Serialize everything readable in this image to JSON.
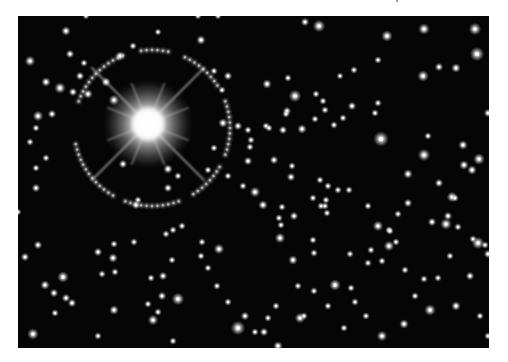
{
  "image": {
    "description": "Grayscale astronomical photograph of a dense starfield with a very bright diffraction-spiked star surrounded by a ring of lensed arcs",
    "background_color": "#050505",
    "page_color": "#ffffff",
    "bright_star": {
      "x": 130,
      "y": 108,
      "core_radius": 16,
      "glow_radius": 44,
      "spike_length": 80
    },
    "ring": {
      "cx": 134,
      "cy": 112,
      "r": 78
    },
    "ring_arcs": [
      {
        "start": 200,
        "end": 250
      },
      {
        "start": 262,
        "end": 282
      },
      {
        "start": 295,
        "end": 330
      },
      {
        "start": 340,
        "end": 380
      },
      {
        "start": 30,
        "end": 60
      },
      {
        "start": 70,
        "end": 110
      },
      {
        "start": 120,
        "end": 170
      }
    ],
    "stars": [
      [
        12,
        45,
        2.2
      ],
      [
        52,
        38,
        1.8
      ],
      [
        66,
        47,
        1.6
      ],
      [
        28,
        66,
        2
      ],
      [
        42,
        72,
        2.4
      ],
      [
        55,
        76,
        1.8
      ],
      [
        70,
        78,
        2
      ],
      [
        88,
        66,
        2
      ],
      [
        96,
        84,
        2.2
      ],
      [
        102,
        40,
        2
      ],
      [
        115,
        30,
        1.6
      ],
      [
        140,
        16,
        1.5
      ],
      [
        183,
        24,
        2
      ],
      [
        196,
        55,
        1.6
      ],
      [
        210,
        60,
        1.8
      ],
      [
        204,
        74,
        1.6
      ],
      [
        20,
        100,
        2.2
      ],
      [
        34,
        98,
        1.8
      ],
      [
        18,
        112,
        1.6
      ],
      [
        12,
        126,
        1.6
      ],
      [
        28,
        142,
        1.6
      ],
      [
        18,
        152,
        1.6
      ],
      [
        62,
        60,
        1.8
      ],
      [
        150,
        153,
        2
      ],
      [
        196,
        132,
        1.6
      ],
      [
        205,
        107,
        2
      ],
      [
        220,
        110,
        1.8
      ],
      [
        230,
        114,
        1.6
      ],
      [
        248,
        110,
        1.6
      ],
      [
        265,
        114,
        1.8
      ],
      [
        284,
        113,
        2
      ],
      [
        18,
        172,
        1.8
      ],
      [
        105,
        148,
        1.8
      ],
      [
        150,
        172,
        1.8
      ],
      [
        120,
        184,
        1.6
      ],
      [
        48,
        15,
        2
      ],
      [
        68,
        0,
        1.5
      ],
      [
        180,
        0,
        1.5
      ],
      [
        200,
        0,
        1.5
      ],
      [
        287,
        6,
        1.8
      ],
      [
        301,
        10,
        2.6
      ],
      [
        369,
        20,
        2.4
      ],
      [
        406,
        13,
        2.4
      ],
      [
        457,
        13,
        2.6
      ],
      [
        459,
        38,
        3
      ],
      [
        438,
        52,
        2
      ],
      [
        421,
        51,
        1.8
      ],
      [
        405,
        60,
        2.4
      ],
      [
        360,
        44,
        1.6
      ],
      [
        336,
        54,
        1.6
      ],
      [
        322,
        60,
        1.5
      ],
      [
        270,
        62,
        1.6
      ],
      [
        249,
        68,
        2
      ],
      [
        277,
        80,
        2.6
      ],
      [
        298,
        78,
        1.6
      ],
      [
        305,
        85,
        1.6
      ],
      [
        269,
        95,
        1.8
      ],
      [
        307,
        94,
        1.6
      ],
      [
        334,
        90,
        1.8
      ],
      [
        360,
        87,
        1.6
      ],
      [
        325,
        102,
        1.6
      ],
      [
        316,
        109,
        1.6
      ],
      [
        297,
        103,
        1.6
      ],
      [
        268,
        98,
        1.6
      ],
      [
        251,
        112,
        1.6
      ],
      [
        230,
        145,
        1.8
      ],
      [
        232,
        131,
        1.6
      ],
      [
        233,
        124,
        1.6
      ],
      [
        256,
        144,
        1.8
      ],
      [
        237,
        176,
        2.2
      ],
      [
        273,
        161,
        1.8
      ],
      [
        274,
        150,
        1.6
      ],
      [
        302,
        164,
        1.6
      ],
      [
        310,
        170,
        1.6
      ],
      [
        308,
        184,
        1.6
      ],
      [
        320,
        174,
        1.6
      ],
      [
        331,
        174,
        1.6
      ],
      [
        295,
        182,
        1.6
      ],
      [
        303,
        190,
        1.6
      ],
      [
        363,
        123,
        3.2
      ],
      [
        357,
        97,
        1.6
      ],
      [
        410,
        120,
        1.6
      ],
      [
        390,
        158,
        2
      ],
      [
        406,
        139,
        2.6
      ],
      [
        445,
        129,
        2
      ],
      [
        470,
        97,
        1.8
      ],
      [
        434,
        181,
        2.2
      ],
      [
        421,
        167,
        1.8
      ],
      [
        437,
        182,
        1.6
      ],
      [
        446,
        149,
        2
      ],
      [
        454,
        154,
        2
      ],
      [
        461,
        143,
        2.4
      ],
      [
        245,
        189,
        2
      ],
      [
        264,
        191,
        1.6
      ],
      [
        276,
        200,
        1.8
      ],
      [
        261,
        202,
        1.6
      ],
      [
        263,
        209,
        1.6
      ],
      [
        307,
        190,
        1.6
      ],
      [
        309,
        197,
        1.6
      ],
      [
        350,
        190,
        1.6
      ],
      [
        380,
        198,
        1.6
      ],
      [
        390,
        187,
        1.8
      ],
      [
        360,
        210,
        2.2
      ],
      [
        371,
        214,
        1.6
      ],
      [
        428,
        208,
        2.4
      ],
      [
        414,
        206,
        1.8
      ],
      [
        430,
        200,
        1.8
      ],
      [
        440,
        211,
        1.6
      ],
      [
        460,
        227,
        2.6
      ],
      [
        470,
        238,
        1.8
      ],
      [
        455,
        223,
        1.6
      ],
      [
        262,
        222,
        2.2
      ],
      [
        295,
        224,
        1.6
      ],
      [
        275,
        244,
        2
      ],
      [
        296,
        237,
        1.6
      ],
      [
        332,
        238,
        1.6
      ],
      [
        353,
        234,
        1.6
      ],
      [
        350,
        247,
        1.6
      ],
      [
        364,
        245,
        1.6
      ],
      [
        371,
        230,
        2.2
      ],
      [
        378,
        226,
        1.6
      ],
      [
        372,
        215,
        1.6
      ],
      [
        387,
        254,
        1.6
      ],
      [
        406,
        263,
        1.6
      ],
      [
        420,
        262,
        1.6
      ],
      [
        412,
        294,
        2.4
      ],
      [
        438,
        290,
        2
      ],
      [
        452,
        260,
        1.8
      ],
      [
        467,
        229,
        1.6
      ],
      [
        386,
        308,
        2
      ],
      [
        364,
        320,
        2.2
      ],
      [
        246,
        316,
        1.8
      ],
      [
        282,
        302,
        2.2
      ],
      [
        286,
        300,
        1.6
      ],
      [
        296,
        275,
        1.6
      ],
      [
        317,
        269,
        2.4
      ],
      [
        333,
        272,
        1.6
      ],
      [
        337,
        286,
        1.6
      ],
      [
        280,
        270,
        1.6
      ],
      [
        250,
        302,
        1.6
      ],
      [
        237,
        316,
        1.6
      ],
      [
        260,
        330,
        2
      ],
      [
        220,
        312,
        3
      ],
      [
        227,
        300,
        1.8
      ],
      [
        201,
        233,
        2.2
      ],
      [
        184,
        226,
        1.6
      ],
      [
        160,
        283,
        2.6
      ],
      [
        144,
        280,
        1.8
      ],
      [
        145,
        260,
        1.8
      ],
      [
        155,
        214,
        1.6
      ],
      [
        164,
        210,
        1.6
      ],
      [
        154,
        244,
        1.6
      ],
      [
        133,
        262,
        1.6
      ],
      [
        140,
        296,
        1.6
      ],
      [
        135,
        304,
        2.2
      ],
      [
        155,
        325,
        1.6
      ],
      [
        130,
        288,
        1.6
      ],
      [
        7,
        241,
        1.8
      ],
      [
        20,
        229,
        1.8
      ],
      [
        27,
        269,
        2
      ],
      [
        45,
        261,
        2.4
      ],
      [
        36,
        277,
        1.8
      ],
      [
        48,
        282,
        1.8
      ],
      [
        54,
        287,
        1.8
      ],
      [
        37,
        297,
        1.6
      ],
      [
        15,
        318,
        2.4
      ],
      [
        80,
        236,
        1.8
      ],
      [
        95,
        242,
        2
      ],
      [
        96,
        228,
        1.6
      ],
      [
        97,
        256,
        1.6
      ],
      [
        84,
        258,
        1.6
      ],
      [
        116,
        226,
        1.6
      ],
      [
        148,
        218,
        1.6
      ],
      [
        118,
        189,
        1.8
      ],
      [
        96,
        294,
        2
      ],
      [
        80,
        320,
        1.6
      ],
      [
        110,
        340,
        1.6
      ],
      [
        183,
        240,
        1.6
      ],
      [
        190,
        252,
        1.6
      ],
      [
        199,
        270,
        1.6
      ],
      [
        210,
        286,
        1.6
      ],
      [
        0,
        196,
        1.5
      ],
      [
        160,
        160,
        1.6
      ],
      [
        190,
        154,
        1.6
      ],
      [
        210,
        160,
        1.6
      ],
      [
        225,
        170,
        1.6
      ],
      [
        258,
        290,
        1.6
      ],
      [
        432,
        240,
        1.6
      ],
      [
        397,
        280,
        1.6
      ],
      [
        462,
        300,
        1.6
      ],
      [
        470,
        320,
        1.6
      ],
      [
        348,
        300,
        1.6
      ],
      [
        326,
        312,
        1.6
      ],
      [
        310,
        290,
        1.6
      ]
    ]
  }
}
